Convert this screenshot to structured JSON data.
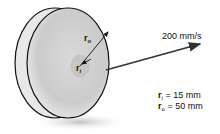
{
  "diagram": {
    "type": "wheel-velocity",
    "colors": {
      "outline": "#111111",
      "rim_light": "#e6e6e6",
      "face": "#cfcfcf",
      "hub": "#c4c4c4",
      "shadow": "#bdbdbd",
      "arrow": "#333333"
    },
    "velocity_label": "200 mm/s",
    "radius_labels": {
      "outer": {
        "symbol": "r",
        "subscript": "o"
      },
      "inner": {
        "symbol": "r",
        "subscript": "i"
      }
    },
    "given": [
      {
        "symbol": "r",
        "subscript": "i",
        "equals": "= 15 mm"
      },
      {
        "symbol": "r",
        "subscript": "o",
        "equals": "= 50 mm"
      }
    ]
  }
}
